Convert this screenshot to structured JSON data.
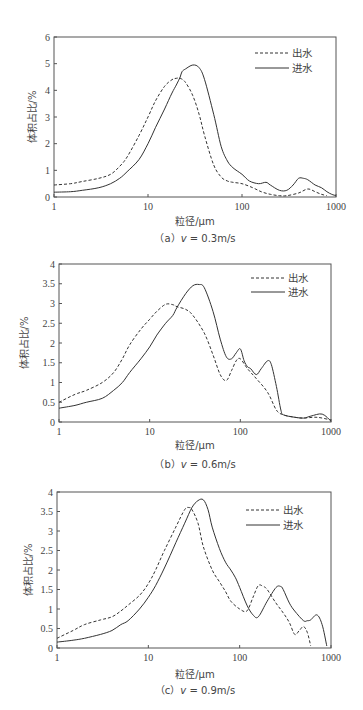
{
  "chart_data": [
    {
      "id": "a",
      "type": "line",
      "title": "",
      "caption": "（a）v = 0.3m/s",
      "xlabel": "粒径/μm",
      "ylabel": "体积占比/%",
      "xscale": "log",
      "xlim": [
        1,
        1000
      ],
      "ylim": [
        0,
        6
      ],
      "xticks": [
        "1",
        "10",
        "100",
        "1000"
      ],
      "yticks": [
        "0",
        "1",
        "2",
        "3",
        "4",
        "5",
        "6"
      ],
      "grid": false,
      "legend_position": "top-right",
      "frame": {
        "left": 54,
        "right": 336,
        "top": 37,
        "bottom": 197
      },
      "series": [
        {
          "name": "出水",
          "style": "dashed",
          "x": [
            1,
            1.5,
            2,
            3,
            4,
            5,
            6,
            8,
            10,
            12,
            15,
            18,
            20,
            22,
            25,
            30,
            35,
            40,
            50,
            60,
            70,
            80,
            100,
            130,
            160,
            200,
            250,
            300,
            400,
            500,
            600,
            700,
            800
          ],
          "y": [
            0.45,
            0.5,
            0.58,
            0.7,
            0.85,
            1.15,
            1.5,
            2.3,
            3.0,
            3.6,
            4.15,
            4.4,
            4.45,
            4.45,
            4.3,
            3.8,
            3.1,
            2.3,
            1.2,
            0.75,
            0.6,
            0.55,
            0.5,
            0.35,
            0.2,
            0.1,
            0.05,
            0.05,
            0.15,
            0.3,
            0.2,
            0.1,
            0.05
          ]
        },
        {
          "name": "进水",
          "style": "solid",
          "x": [
            1,
            1.5,
            2,
            3,
            4,
            5,
            6,
            8,
            10,
            12,
            15,
            18,
            20,
            22,
            23,
            25,
            30,
            35,
            40,
            50,
            60,
            70,
            80,
            100,
            120,
            150,
            180,
            200,
            250,
            300,
            350,
            400,
            450,
            500,
            600,
            700,
            800,
            900,
            1000
          ],
          "y": [
            0.18,
            0.2,
            0.25,
            0.35,
            0.5,
            0.7,
            0.95,
            1.4,
            2.0,
            2.6,
            3.3,
            3.9,
            4.2,
            4.5,
            4.7,
            4.8,
            4.95,
            4.85,
            4.4,
            3.1,
            1.9,
            1.35,
            1.1,
            0.85,
            0.6,
            0.5,
            0.55,
            0.45,
            0.25,
            0.25,
            0.45,
            0.7,
            0.7,
            0.65,
            0.45,
            0.35,
            0.2,
            0.1,
            0.05
          ]
        }
      ]
    },
    {
      "id": "b",
      "type": "line",
      "title": "",
      "caption": "（b）v = 0.6m/s",
      "xlabel": "粒径/μm",
      "ylabel": "体积占比/%",
      "xscale": "log",
      "xlim": [
        1,
        1000
      ],
      "ylim": [
        0,
        4
      ],
      "xticks": [
        "1",
        "10",
        "100",
        "1000"
      ],
      "yticks": [
        "0",
        "0.5",
        "1",
        "1.5",
        "2",
        "2.5",
        "3",
        "3.5",
        "4"
      ],
      "grid": false,
      "legend_position": "top-right",
      "frame": {
        "left": 59,
        "right": 331,
        "top": 264,
        "bottom": 422
      },
      "series": [
        {
          "name": "出水",
          "style": "dashed",
          "x": [
            1,
            1.5,
            2,
            3,
            4,
            5,
            6,
            8,
            10,
            12,
            15,
            18,
            20,
            25,
            30,
            40,
            50,
            60,
            70,
            80,
            90,
            100,
            120,
            150,
            200,
            250,
            300,
            400,
            500,
            700,
            1000
          ],
          "y": [
            0.5,
            0.7,
            0.8,
            1.0,
            1.25,
            1.6,
            1.95,
            2.35,
            2.6,
            2.8,
            2.98,
            2.97,
            2.92,
            2.85,
            2.7,
            2.25,
            1.7,
            1.2,
            1.05,
            1.3,
            1.55,
            1.6,
            1.35,
            1.1,
            0.75,
            0.3,
            0.18,
            0.12,
            0.1,
            0.12,
            0.05
          ]
        },
        {
          "name": "进水",
          "style": "solid",
          "x": [
            1,
            1.5,
            2,
            3,
            4,
            5,
            6,
            8,
            10,
            12,
            15,
            18,
            20,
            25,
            30,
            35,
            40,
            50,
            60,
            70,
            80,
            90,
            100,
            110,
            120,
            130,
            150,
            170,
            200,
            220,
            250,
            280,
            300,
            400,
            500,
            600,
            800,
            1000
          ],
          "y": [
            0.35,
            0.42,
            0.5,
            0.6,
            0.8,
            1.0,
            1.25,
            1.6,
            1.9,
            2.2,
            2.5,
            2.7,
            2.9,
            3.25,
            3.45,
            3.48,
            3.4,
            2.8,
            2.1,
            1.65,
            1.6,
            1.75,
            1.85,
            1.55,
            1.4,
            1.35,
            1.2,
            1.35,
            1.55,
            1.45,
            0.9,
            0.3,
            0.18,
            0.12,
            0.1,
            0.15,
            0.2,
            0.02
          ]
        }
      ]
    },
    {
      "id": "c",
      "type": "line",
      "title": "",
      "caption": "（c）v = 0.9m/s",
      "xlabel": "粒径/μm",
      "ylabel": "体积占比/%",
      "xscale": "log",
      "xlim": [
        1,
        1000
      ],
      "ylim": [
        0,
        4
      ],
      "xticks": [
        "1",
        "10",
        "100",
        "1000"
      ],
      "yticks": [
        "0",
        "0.5",
        "1",
        "1.5",
        "2",
        "2.5",
        "3",
        "3.5",
        "4"
      ],
      "grid": false,
      "legend_position": "top-right",
      "frame": {
        "left": 57,
        "right": 331,
        "top": 492,
        "bottom": 648
      },
      "series": [
        {
          "name": "出水",
          "style": "dashed",
          "x": [
            1,
            1.5,
            2,
            3,
            4,
            5,
            6,
            8,
            10,
            12,
            15,
            20,
            25,
            28,
            30,
            35,
            40,
            50,
            60,
            70,
            80,
            100,
            120,
            140,
            160,
            180,
            200,
            250,
            300,
            350,
            400,
            450,
            500,
            550,
            600
          ],
          "y": [
            0.25,
            0.45,
            0.6,
            0.72,
            0.8,
            0.95,
            1.1,
            1.35,
            1.65,
            2.0,
            2.5,
            3.1,
            3.55,
            3.6,
            3.55,
            3.2,
            2.6,
            2.0,
            1.7,
            1.45,
            1.2,
            1.0,
            0.95,
            1.3,
            1.6,
            1.58,
            1.5,
            1.15,
            0.9,
            0.65,
            0.35,
            0.45,
            0.55,
            0.4,
            0.05
          ]
        },
        {
          "name": "进水",
          "style": "solid",
          "x": [
            1,
            1.5,
            2,
            3,
            4,
            5,
            6,
            8,
            10,
            12,
            15,
            20,
            25,
            30,
            35,
            40,
            45,
            50,
            60,
            70,
            80,
            90,
            100,
            120,
            140,
            160,
            200,
            250,
            280,
            300,
            350,
            400,
            500,
            550,
            600,
            700,
            800,
            900
          ],
          "y": [
            0.15,
            0.2,
            0.25,
            0.35,
            0.45,
            0.6,
            0.7,
            1.0,
            1.3,
            1.6,
            2.05,
            2.7,
            3.2,
            3.6,
            3.78,
            3.8,
            3.55,
            3.1,
            2.55,
            2.2,
            2.0,
            1.8,
            1.55,
            1.1,
            0.85,
            0.8,
            1.2,
            1.55,
            1.58,
            1.5,
            1.15,
            0.95,
            0.7,
            0.7,
            0.72,
            0.85,
            0.6,
            0.05
          ]
        }
      ]
    }
  ],
  "charts": [
    {
      "ylabel": "体积占比/%",
      "xlabel": "粒径/μm",
      "caption_prefix": "（a）",
      "caption_v": "v",
      "caption_value": " = 0.3m/s",
      "legend": [
        "出水",
        "进水"
      ]
    },
    {
      "ylabel": "体积占比/%",
      "xlabel": "粒径/μm",
      "caption_prefix": "（b）",
      "caption_v": "v",
      "caption_value": " = 0.6m/s",
      "legend": [
        "出水",
        "进水"
      ]
    },
    {
      "ylabel": "体积占比/%",
      "xlabel": "粒径/μm",
      "caption_prefix": "（c）",
      "caption_v": "v",
      "caption_value": " = 0.9m/s",
      "legend": [
        "出水",
        "进水"
      ]
    }
  ]
}
